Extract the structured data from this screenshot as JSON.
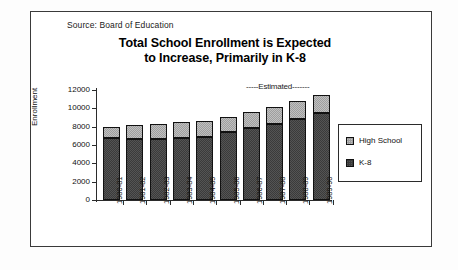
{
  "frame": {
    "border_color": "#3a3a3a",
    "background": "#ffffff"
  },
  "source_note": "Source:  Board of Education",
  "title": {
    "line1": "Total School Enrollment is Expected",
    "line2": "to Increase, Primarily in K-8"
  },
  "annotation": {
    "estimated": "-----Estimated-------"
  },
  "legend": {
    "items": [
      {
        "label": "High School",
        "color": "#9e9e9e"
      },
      {
        "label": "K-8",
        "color": "#3b3b3b"
      }
    ]
  },
  "chart_data": {
    "type": "bar",
    "stacked": true,
    "title": "Total School Enrollment is Expected to Increase, Primarily in K-8",
    "xlabel": "",
    "ylabel": "Enrollment",
    "ylim": [
      0,
      12000
    ],
    "yticks": [
      0,
      2000,
      4000,
      6000,
      8000,
      10000,
      12000
    ],
    "ytick_labels": [
      "0",
      "2000",
      "4000",
      "6000",
      "8000",
      "10000",
      "12000"
    ],
    "grid": false,
    "legend_position": "right",
    "categories": [
      "1980-81",
      "1981-82",
      "1982-83",
      "1983-84",
      "1984-85",
      "1985-86",
      "1986-87",
      "1987-88",
      "1988-89",
      "1989-90"
    ],
    "series": [
      {
        "name": "K-8",
        "color": "#3b3b3b",
        "values": [
          6800,
          6700,
          6700,
          6800,
          6850,
          7400,
          7850,
          8250,
          8800,
          9500
        ]
      },
      {
        "name": "High School",
        "color": "#9e9e9e",
        "values": [
          1200,
          1450,
          1600,
          1700,
          1750,
          1700,
          1700,
          1950,
          1950,
          2000
        ]
      }
    ],
    "totals": [
      8000,
      8150,
      8300,
      8500,
      8600,
      9100,
      9550,
      10200,
      10750,
      11500
    ],
    "annotations": [
      {
        "text": "-----Estimated-------",
        "applies_to": [
          "1987-88",
          "1988-89",
          "1989-90"
        ]
      }
    ],
    "source": "Source:  Board of Education"
  }
}
